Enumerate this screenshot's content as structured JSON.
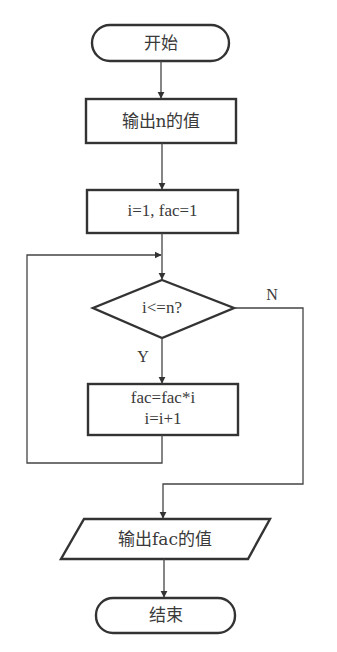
{
  "diagram": {
    "type": "flowchart",
    "stroke_color": "#333333",
    "text_color": "#3a3a3a",
    "nodes": {
      "start": {
        "shape": "terminal",
        "label": "开始"
      },
      "output_n": {
        "shape": "process",
        "label": "输出n的值"
      },
      "init": {
        "shape": "process",
        "label": "i=1, fac=1"
      },
      "condition": {
        "shape": "decision",
        "label": "i<=n?"
      },
      "loop_body": {
        "shape": "process",
        "line1": "fac=fac*i",
        "line2": "i=i+1"
      },
      "output_fac": {
        "shape": "io",
        "label": "输出fac的值"
      },
      "end": {
        "shape": "terminal",
        "label": "结束"
      }
    },
    "edge_labels": {
      "yes": "Y",
      "no": "N"
    },
    "edges": [
      {
        "from": "start",
        "to": "output_n"
      },
      {
        "from": "output_n",
        "to": "init"
      },
      {
        "from": "init",
        "to": "condition"
      },
      {
        "from": "condition",
        "to": "loop_body",
        "label": "Y"
      },
      {
        "from": "loop_body",
        "to": "condition"
      },
      {
        "from": "condition",
        "to": "output_fac",
        "label": "N"
      },
      {
        "from": "output_fac",
        "to": "end"
      }
    ]
  }
}
